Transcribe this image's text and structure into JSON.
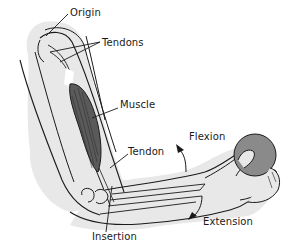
{
  "diagram": {
    "labels": {
      "origin": "Origin",
      "tendons": "Tendons",
      "muscle": "Muscle",
      "tendon": "Tendon",
      "flexion": "Flexion",
      "insertion": "Insertion",
      "extension": "Extension"
    },
    "colors": {
      "background": "#ffffff",
      "skin_fill": "#e8e8e8",
      "outline": "#1a1a1a",
      "muscle_fill": "#5a5a5a",
      "ball_fill": "#8a8a8a"
    }
  }
}
